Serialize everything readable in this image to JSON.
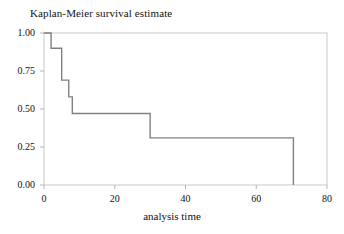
{
  "chart_data": {
    "type": "line",
    "subtype": "step-post",
    "title": "Kaplan-Meier survival estimate",
    "xlabel": "analysis time",
    "ylabel": "",
    "xlim": [
      0,
      80
    ],
    "ylim": [
      0,
      1
    ],
    "grid": false,
    "legend": "none",
    "line_color": "#808080",
    "axis_color": "#b5b5b5",
    "xticks": [
      0,
      20,
      40,
      60,
      80
    ],
    "xtick_labels": [
      "0",
      "20",
      "40",
      "60",
      "80"
    ],
    "yticks": [
      0.0,
      0.25,
      0.5,
      0.75,
      1.0
    ],
    "ytick_labels": [
      "0.00",
      "0.25",
      "0.50",
      "0.75",
      "1.00"
    ],
    "series": [
      {
        "name": "survival estimate",
        "x": [
          0,
          2,
          2,
          5,
          5,
          7,
          7,
          8,
          8,
          30,
          30,
          70.5,
          70.5
        ],
        "y": [
          1.0,
          1.0,
          0.9,
          0.9,
          0.69,
          0.69,
          0.58,
          0.58,
          0.47,
          0.47,
          0.31,
          0.31,
          0.0
        ]
      }
    ],
    "steps": [
      {
        "time": 0,
        "survival": 1.0
      },
      {
        "time": 2,
        "survival": 0.9
      },
      {
        "time": 5,
        "survival": 0.69
      },
      {
        "time": 7,
        "survival": 0.58
      },
      {
        "time": 8,
        "survival": 0.47
      },
      {
        "time": 30,
        "survival": 0.31
      },
      {
        "time": 70.5,
        "survival": 0.0
      }
    ]
  }
}
